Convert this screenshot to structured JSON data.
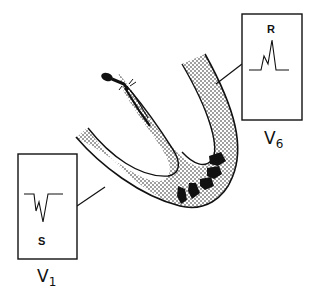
{
  "diagram": {
    "colors": {
      "ink": "#111111",
      "background": "#ffffff",
      "myocardium_stipple": "#111111"
    },
    "leads": [
      {
        "id": "V1",
        "label_main": "V",
        "label_sub": "1",
        "wave_label": "S",
        "wave_description": "small r, deep S (negative deflection)"
      },
      {
        "id": "V6",
        "label_main": "V",
        "label_sub": "6",
        "wave_label": "R",
        "wave_description": "small notch then tall R (positive deflection)"
      }
    ],
    "ventricle": {
      "description": "U-shaped stippled ventricular wall with conduction bundle at top of septum",
      "arrow_count": 5,
      "arrow_direction": "toward lateral wall / V6"
    }
  }
}
